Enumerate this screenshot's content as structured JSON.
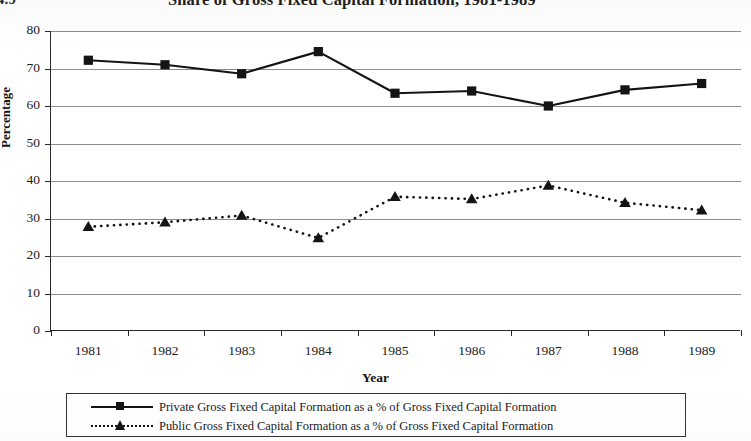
{
  "figure": {
    "label": "e 4.9",
    "title": "Share of Gross Fixed Capital Formation, 1981-1989"
  },
  "axes": {
    "y_title": "Percentage",
    "x_title": "Year",
    "y_ticks": [
      "0",
      "10",
      "20",
      "30",
      "40",
      "50",
      "60",
      "70",
      "80"
    ],
    "x_ticks": [
      "1981",
      "1982",
      "1983",
      "1984",
      "1985",
      "1986",
      "1987",
      "1988",
      "1989"
    ]
  },
  "legend": {
    "items": [
      {
        "label": "Private Gross Fixed Capital Formation as a % of Gross Fixed Capital Formation",
        "marker": "square",
        "line": "solid",
        "color": "#141414"
      },
      {
        "label": "Public Gross Fixed Capital Formation as a % of Gross Fixed Capital Formation",
        "marker": "triangle",
        "line": "dotted",
        "color": "#141414"
      }
    ]
  },
  "chart_data": {
    "type": "line",
    "title": "Share of Gross Fixed Capital Formation, 1981-1989",
    "xlabel": "Year",
    "ylabel": "Percentage",
    "categories": [
      "1981",
      "1982",
      "1983",
      "1984",
      "1985",
      "1986",
      "1987",
      "1988",
      "1989"
    ],
    "ylim": [
      0,
      80
    ],
    "ytick_step": 10,
    "grid": true,
    "legend_position": "bottom",
    "series": [
      {
        "name": "Private Gross Fixed Capital Formation as a % of Gross Fixed Capital Formation",
        "marker": "square",
        "line": "solid",
        "color": "#141414",
        "values": [
          72.2,
          71.0,
          68.6,
          74.5,
          63.4,
          64.0,
          60.0,
          64.3,
          66.0
        ]
      },
      {
        "name": "Public Gross Fixed Capital Formation as a % of Gross Fixed Capital Formation",
        "marker": "triangle",
        "line": "dotted",
        "color": "#141414",
        "values": [
          27.8,
          29.0,
          30.8,
          24.8,
          35.8,
          35.2,
          38.8,
          34.2,
          32.2
        ]
      }
    ]
  }
}
